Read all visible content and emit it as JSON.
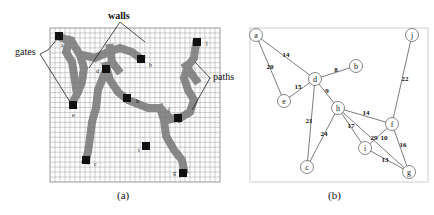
{
  "panel_a": {
    "caption": "(a)",
    "labels": {
      "walls": "walls",
      "gates": "gates",
      "paths": "paths"
    },
    "grid": {
      "x": 50,
      "y": 28,
      "width": 170,
      "height": 154,
      "cols": 34,
      "rows": 31
    },
    "gates": [
      {
        "id": "a",
        "gx": 3,
        "gy": 2
      },
      {
        "id": "b",
        "gx": 26,
        "gy": 12
      },
      {
        "id": "d",
        "gx": 16,
        "gy": 9
      },
      {
        "id": "h",
        "gx": 21,
        "gy": 7
      },
      {
        "id": "j",
        "gx": 42,
        "gy": 3
      },
      {
        "id": "e",
        "gx": 10,
        "gy": 19
      },
      {
        "id": "f",
        "gx": 39,
        "gy": 21
      },
      {
        "id": "i",
        "gx": 29,
        "gy": 28
      },
      {
        "id": "c",
        "gx": 21,
        "gy": 32
      },
      {
        "id": "g",
        "gx": 41,
        "gy": 35
      }
    ]
  },
  "panel_b": {
    "caption": "(b)",
    "nodes": [
      {
        "id": "a",
        "x": 256,
        "y": 35
      },
      {
        "id": "b",
        "x": 356,
        "y": 66
      },
      {
        "id": "d",
        "x": 315,
        "y": 79
      },
      {
        "id": "e",
        "x": 284,
        "y": 101
      },
      {
        "id": "h",
        "x": 338,
        "y": 108
      },
      {
        "id": "j",
        "x": 412,
        "y": 35
      },
      {
        "id": "f",
        "x": 392,
        "y": 124
      },
      {
        "id": "i",
        "x": 365,
        "y": 148
      },
      {
        "id": "c",
        "x": 307,
        "y": 167
      },
      {
        "id": "g",
        "x": 409,
        "y": 172
      }
    ],
    "edges": [
      {
        "from": "a",
        "to": "d",
        "weight": "14",
        "lx": 286,
        "ly": 57
      },
      {
        "from": "a",
        "to": "e",
        "weight": "20",
        "lx": 270,
        "ly": 69
      },
      {
        "from": "d",
        "to": "b",
        "weight": "8",
        "lx": 336,
        "ly": 72
      },
      {
        "from": "d",
        "to": "e",
        "weight": "15",
        "lx": 298,
        "ly": 89
      },
      {
        "from": "d",
        "to": "h",
        "weight": "9",
        "lx": 327,
        "ly": 93
      },
      {
        "from": "d",
        "to": "c",
        "weight": "21",
        "lx": 309,
        "ly": 123
      },
      {
        "from": "h",
        "to": "f",
        "weight": "14",
        "lx": 366,
        "ly": 115
      },
      {
        "from": "h",
        "to": "c",
        "weight": "24",
        "lx": 324,
        "ly": 136
      },
      {
        "from": "h",
        "to": "i",
        "weight": "17",
        "lx": 351,
        "ly": 128
      },
      {
        "from": "h",
        "to": "g",
        "weight": "29",
        "lx": 374,
        "ly": 140
      },
      {
        "from": "i",
        "to": "f",
        "weight": "10",
        "lx": 384,
        "ly": 140
      },
      {
        "from": "i",
        "to": "g",
        "weight": "13",
        "lx": 385,
        "ly": 162
      },
      {
        "from": "f",
        "to": "g",
        "weight": "16",
        "lx": 403,
        "ly": 147
      },
      {
        "from": "j",
        "to": "f",
        "weight": "22",
        "lx": 405,
        "ly": 81
      }
    ]
  }
}
